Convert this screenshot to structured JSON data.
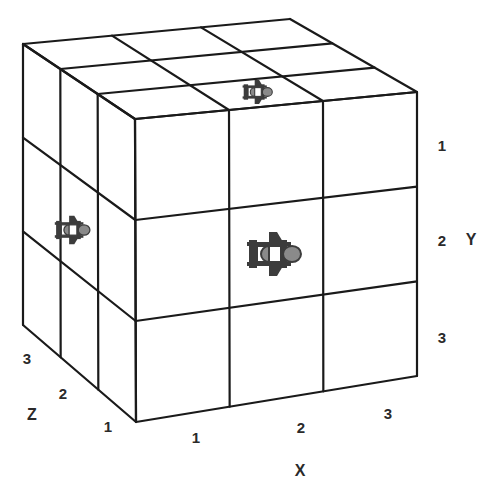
{
  "diagram": {
    "type": "3x3x3 grid cube",
    "colors": {
      "line": "#1a1a1a",
      "background": "#ffffff",
      "icon": "#3c3c3c",
      "icon_light": "#8a8a8a",
      "text": "#2a2a2a"
    },
    "vertices": {
      "front_top_left": [
        135,
        119
      ],
      "front_top_right": [
        417,
        92
      ],
      "front_bottom_right": [
        417,
        376
      ],
      "front_bottom_left": [
        136,
        422
      ],
      "back_top_left": [
        23,
        44
      ],
      "back_top_right": [
        290,
        19
      ],
      "back_bottom_left": [
        23,
        325
      ]
    },
    "axes": {
      "x": {
        "name": "X",
        "ticks": [
          "1",
          "2",
          "3"
        ]
      },
      "y": {
        "name": "Y",
        "ticks": [
          "1",
          "2",
          "3"
        ]
      },
      "z": {
        "name": "Z",
        "ticks": [
          "1",
          "2",
          "3"
        ]
      }
    },
    "labels": [
      {
        "id": "x1",
        "text": "1",
        "pos": [
          196,
          437
        ]
      },
      {
        "id": "x2",
        "text": "2",
        "pos": [
          301,
          427
        ]
      },
      {
        "id": "x3",
        "text": "3",
        "pos": [
          388,
          413
        ]
      },
      {
        "id": "xname",
        "text": "X",
        "pos": [
          300,
          471
        ]
      },
      {
        "id": "y1",
        "text": "1",
        "pos": [
          442,
          145
        ]
      },
      {
        "id": "y2",
        "text": "2",
        "pos": [
          442,
          240
        ]
      },
      {
        "id": "y3",
        "text": "3",
        "pos": [
          442,
          337
        ]
      },
      {
        "id": "yname",
        "text": "Y",
        "pos": [
          471,
          240
        ]
      },
      {
        "id": "z1",
        "text": "1",
        "pos": [
          108,
          426
        ]
      },
      {
        "id": "z2",
        "text": "2",
        "pos": [
          63,
          393
        ]
      },
      {
        "id": "z3",
        "text": "3",
        "pos": [
          27,
          358
        ]
      },
      {
        "id": "zname",
        "text": "Z",
        "pos": [
          32,
          415
        ]
      }
    ],
    "markers": [
      {
        "id": "marker-top",
        "face": "top",
        "cell": "x2,z2",
        "pos": [
          258,
          92
        ],
        "scale": 0.55
      },
      {
        "id": "marker-front",
        "face": "front",
        "cell": "x2,y2",
        "pos": [
          275,
          254
        ],
        "scale": 1.0
      },
      {
        "id": "marker-left",
        "face": "left",
        "cell": "z2,y2",
        "pos": [
          73,
          230
        ],
        "scale": 0.65
      }
    ]
  }
}
